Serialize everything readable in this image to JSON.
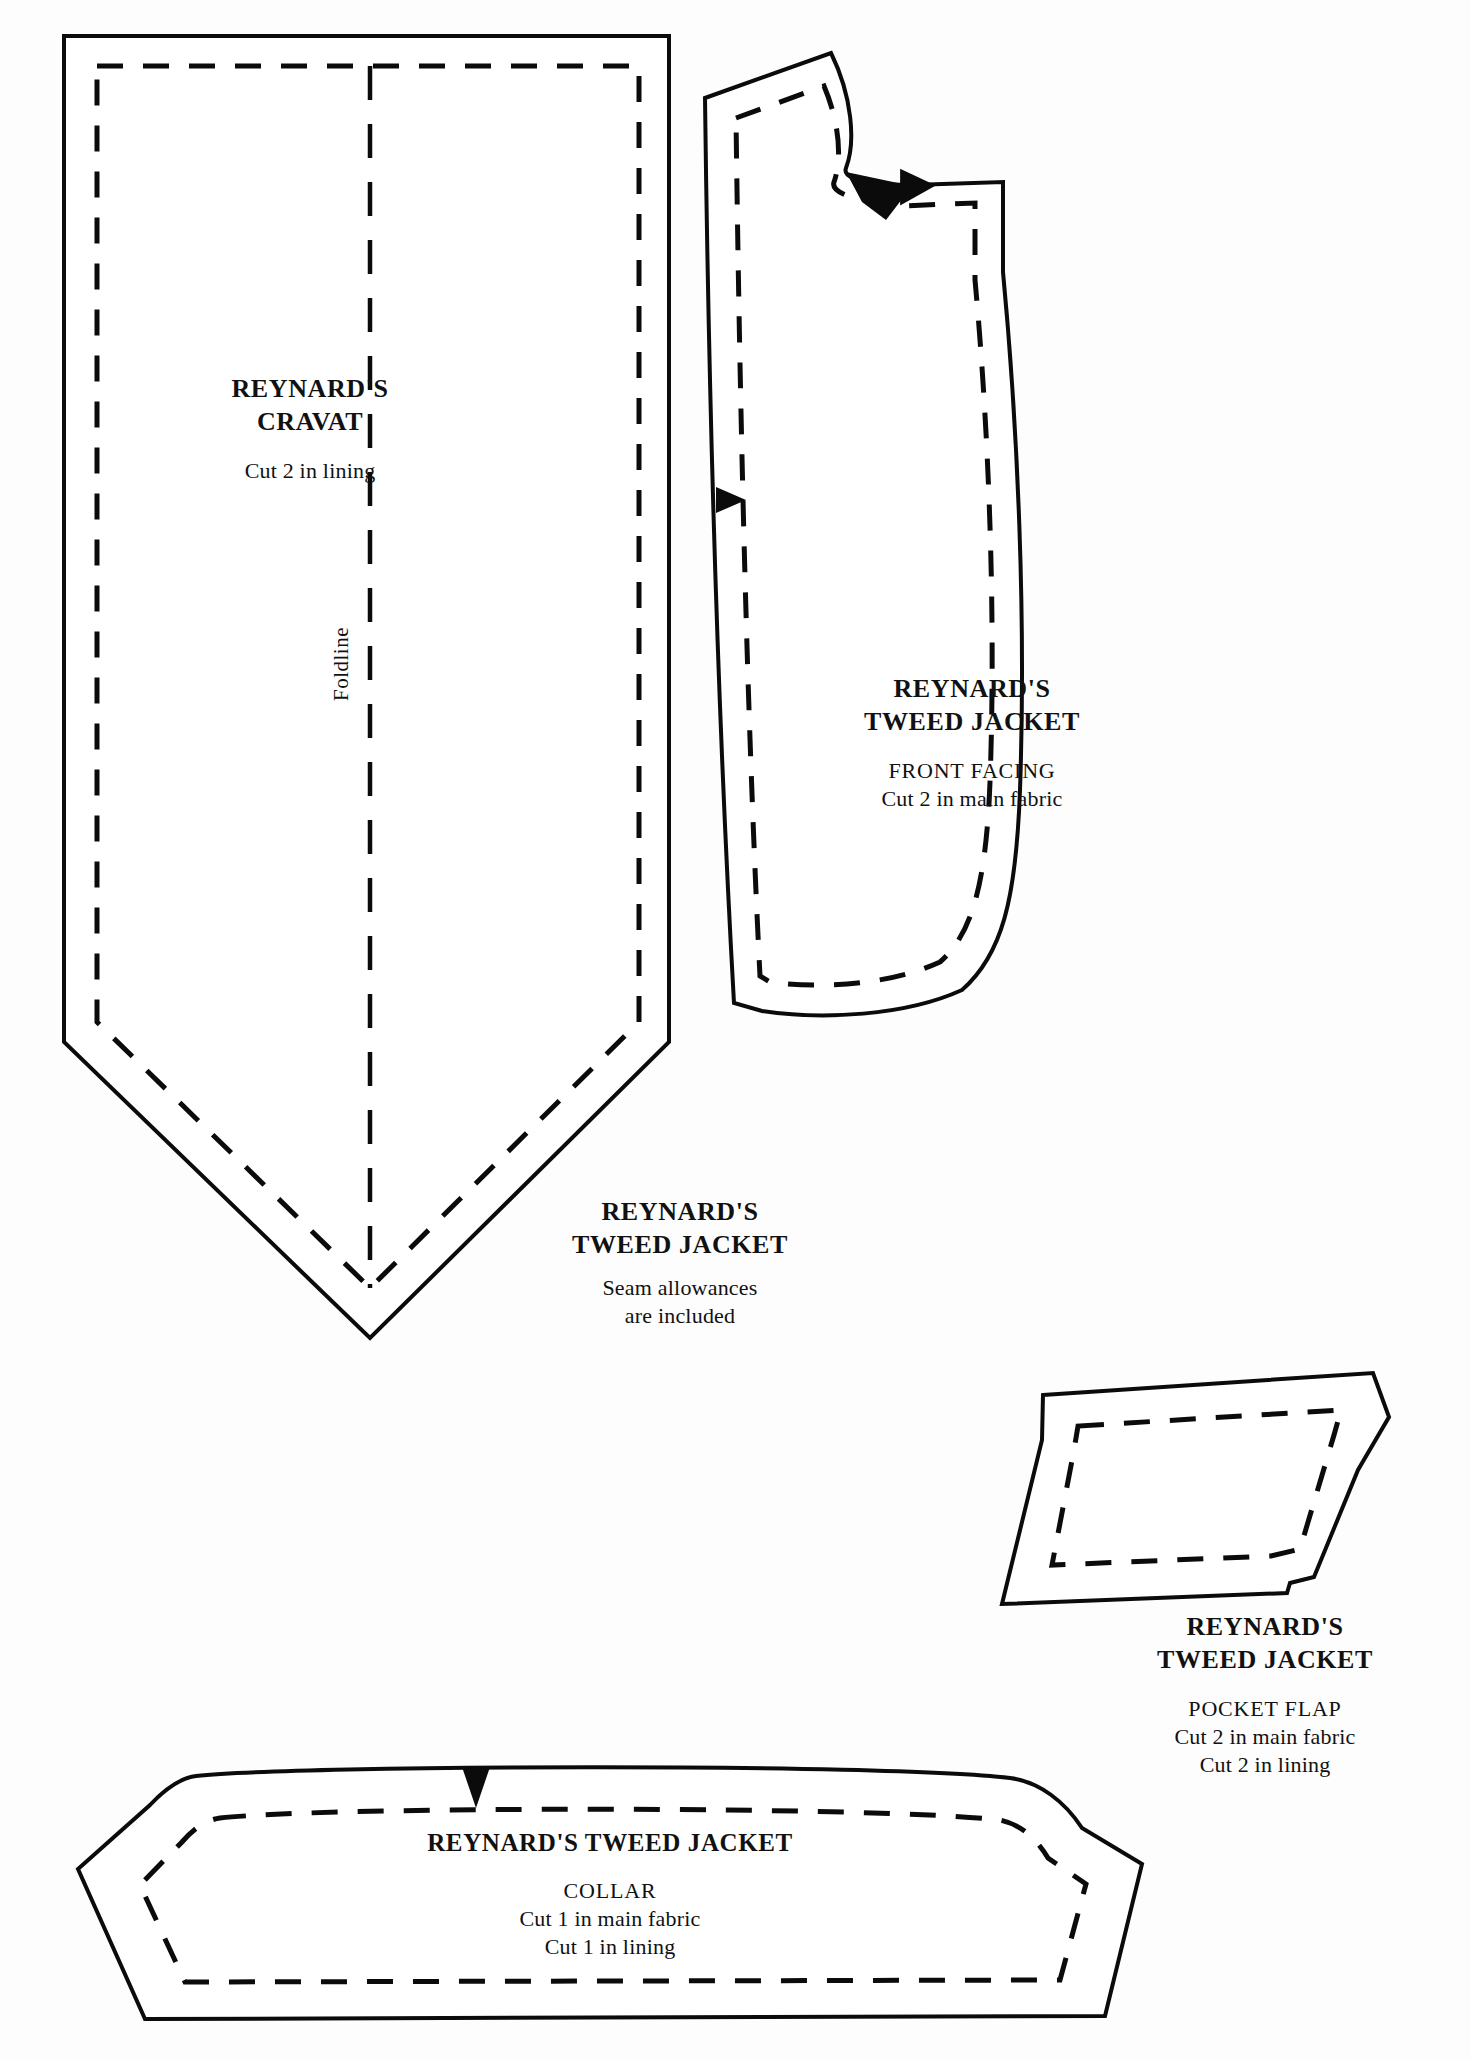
{
  "sheet": {
    "background_color": "#fdfdfd",
    "ink_color": "#0b0b0b"
  },
  "pieces": [
    {
      "id": "cravat",
      "name": "cravat-piece",
      "title_line_1": "REYNARD'S",
      "title_line_2": "CRAVAT",
      "instructions": [
        "Cut 2 in lining"
      ],
      "foldline_label": "Foldline",
      "has_foldline": true,
      "has_seam_allowance_dashes": true,
      "notches": []
    },
    {
      "id": "front-facing",
      "name": "front-facing-piece",
      "title_line_1": "REYNARD'S",
      "title_line_2": "TWEED JACKET",
      "subtitle": "FRONT FACING",
      "instructions": [
        "Cut 2 in main fabric"
      ],
      "has_seam_allowance_dashes": true,
      "notches": [
        "neckline-notch-triangle",
        "side-notch-triangle"
      ]
    },
    {
      "id": "pocket-flap",
      "name": "pocket-flap-piece",
      "title_line_1": "REYNARD'S",
      "title_line_2": "TWEED JACKET",
      "subtitle": "POCKET FLAP",
      "instructions": [
        "Cut 2 in main fabric",
        "Cut 2 in lining"
      ],
      "has_seam_allowance_dashes": true,
      "notches": []
    },
    {
      "id": "collar",
      "name": "collar-piece",
      "title_line_1": "REYNARD'S TWEED JACKET",
      "subtitle": "COLLAR",
      "instructions": [
        "Cut 1 in main fabric",
        "Cut 1 in lining"
      ],
      "has_seam_allowance_dashes": true,
      "notches": [
        "center-back-notch-triangle"
      ]
    }
  ],
  "labels": {
    "cravat": {
      "title_1": "REYNARD'S",
      "title_2": "CRAVAT",
      "cut_1": "Cut 2 in lining",
      "foldline": "Foldline"
    },
    "jacket_general": {
      "title_1": "REYNARD'S",
      "title_2": "TWEED JACKET",
      "note_1": "Seam allowances",
      "note_2": "are included"
    },
    "front_facing": {
      "title_1": "REYNARD'S",
      "title_2": "TWEED JACKET",
      "subtitle": "FRONT FACING",
      "cut_1": "Cut 2 in main fabric"
    },
    "pocket_flap": {
      "title_1": "REYNARD'S",
      "title_2": "TWEED JACKET",
      "subtitle": "POCKET FLAP",
      "cut_1": "Cut 2 in main fabric",
      "cut_2": "Cut 2 in lining"
    },
    "collar": {
      "title_1": "REYNARD'S TWEED JACKET",
      "subtitle": "COLLAR",
      "cut_1": "Cut 1 in main fabric",
      "cut_2": "Cut 1 in lining"
    }
  }
}
